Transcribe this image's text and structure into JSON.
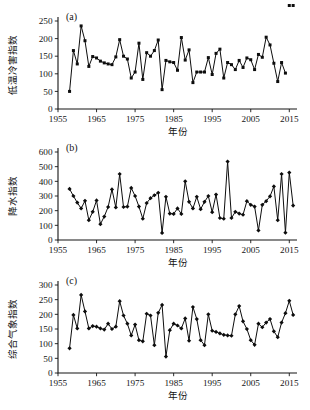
{
  "figure": {
    "background": "#ffffff",
    "ink_color": "#0d0d0d",
    "xlabel": "年份",
    "x_ticks": [
      "1955",
      "1965",
      "1975",
      "1985",
      "1995",
      "2005",
      "2015"
    ],
    "panel_tags": {
      "a": "(a)",
      "b": "(b)",
      "c": "(c)"
    }
  },
  "chart_data": [
    {
      "type": "line",
      "panel": "(a)",
      "title": "",
      "xlabel": "年份",
      "ylabel": "低温冷害指数",
      "marker": "square",
      "grid": false,
      "legend": "none",
      "xlim": [
        1955,
        2017
      ],
      "ylim": [
        0,
        250
      ],
      "y_ticks": [
        0,
        50,
        100,
        150,
        200,
        250
      ],
      "x_ticks": [
        1955,
        1965,
        1975,
        1985,
        1995,
        2005,
        2015
      ],
      "x": [
        1958,
        1959,
        1960,
        1961,
        1962,
        1963,
        1964,
        1965,
        1966,
        1967,
        1968,
        1969,
        1970,
        1971,
        1972,
        1973,
        1974,
        1975,
        1976,
        1977,
        1978,
        1979,
        1980,
        1981,
        1982,
        1983,
        1984,
        1985,
        1986,
        1987,
        1988,
        1989,
        1990,
        1991,
        1992,
        1993,
        1994,
        1995,
        1996,
        1997,
        1998,
        1999,
        2000,
        2001,
        2002,
        2003,
        2004,
        2005,
        2006,
        2007,
        2008,
        2009,
        2010,
        2011,
        2012,
        2013,
        2014,
        2015,
        2016
      ],
      "values": [
        50,
        166,
        128,
        236,
        194,
        121,
        149,
        145,
        136,
        131,
        128,
        126,
        148,
        197,
        150,
        142,
        88,
        105,
        187,
        84,
        160,
        150,
        166,
        196,
        55,
        138,
        134,
        132,
        110,
        203,
        139,
        168,
        75,
        105,
        105,
        105,
        146,
        98,
        158,
        170,
        88,
        132,
        126,
        112,
        138,
        118,
        145,
        140,
        112,
        155,
        147,
        204,
        182,
        130,
        78,
        132,
        102
      ]
    },
    {
      "type": "line",
      "panel": "(b)",
      "title": "",
      "xlabel": "年份",
      "ylabel": "降水指数",
      "marker": "diamond",
      "grid": false,
      "legend": "none",
      "xlim": [
        1955,
        2017
      ],
      "ylim": [
        0,
        600
      ],
      "y_ticks": [
        0,
        100,
        200,
        300,
        400,
        500,
        600
      ],
      "x_ticks": [
        1955,
        1965,
        1975,
        1985,
        1995,
        2005,
        2015
      ],
      "x": [
        1958,
        1959,
        1960,
        1961,
        1962,
        1963,
        1964,
        1965,
        1966,
        1967,
        1968,
        1969,
        1970,
        1971,
        1972,
        1973,
        1974,
        1975,
        1976,
        1977,
        1978,
        1979,
        1980,
        1981,
        1982,
        1983,
        1984,
        1985,
        1986,
        1987,
        1988,
        1989,
        1990,
        1991,
        1992,
        1993,
        1994,
        1995,
        1996,
        1997,
        1998,
        1999,
        2000,
        2001,
        2002,
        2003,
        2004,
        2005,
        2006,
        2007,
        2008,
        2009,
        2010,
        2011,
        2012,
        2013,
        2014,
        2015,
        2016
      ],
      "values": [
        348,
        300,
        255,
        215,
        267,
        135,
        192,
        270,
        108,
        160,
        225,
        345,
        222,
        450,
        225,
        228,
        355,
        300,
        228,
        145,
        252,
        285,
        305,
        322,
        48,
        295,
        180,
        178,
        215,
        178,
        400,
        260,
        215,
        295,
        210,
        260,
        300,
        190,
        310,
        150,
        145,
        535,
        150,
        192,
        180,
        172,
        265,
        240,
        228,
        65,
        240,
        265,
        298,
        365,
        135,
        450,
        50,
        460,
        235
      ]
    },
    {
      "type": "line",
      "panel": "(c)",
      "title": "",
      "xlabel": "年份",
      "ylabel": "综合气象指数",
      "marker": "diamond",
      "grid": false,
      "legend": "none",
      "xlim": [
        1955,
        2017
      ],
      "ylim": [
        0,
        300
      ],
      "y_ticks": [
        0,
        50,
        100,
        150,
        200,
        250,
        300
      ],
      "x_ticks": [
        1955,
        1965,
        1975,
        1985,
        1995,
        2005,
        2015
      ],
      "x": [
        1958,
        1959,
        1960,
        1961,
        1962,
        1963,
        1964,
        1965,
        1966,
        1967,
        1968,
        1969,
        1970,
        1971,
        1972,
        1973,
        1974,
        1975,
        1976,
        1977,
        1978,
        1979,
        1980,
        1981,
        1982,
        1983,
        1984,
        1985,
        1986,
        1987,
        1988,
        1989,
        1990,
        1991,
        1992,
        1993,
        1994,
        1995,
        1996,
        1997,
        1998,
        1999,
        2000,
        2001,
        2002,
        2003,
        2004,
        2005,
        2006,
        2007,
        2008,
        2009,
        2010,
        2011,
        2012,
        2013,
        2014,
        2015,
        2016
      ],
      "values": [
        84,
        198,
        152,
        266,
        210,
        152,
        160,
        158,
        152,
        148,
        168,
        150,
        158,
        245,
        196,
        168,
        128,
        165,
        112,
        108,
        202,
        196,
        95,
        205,
        232,
        56,
        146,
        168,
        162,
        152,
        186,
        110,
        225,
        184,
        112,
        95,
        200,
        144,
        140,
        135,
        130,
        128,
        127,
        200,
        228,
        176,
        150,
        112,
        96,
        168,
        156,
        172,
        184,
        142,
        122,
        172,
        204,
        246,
        198,
        180,
        84,
        180,
        124
      ]
    }
  ]
}
